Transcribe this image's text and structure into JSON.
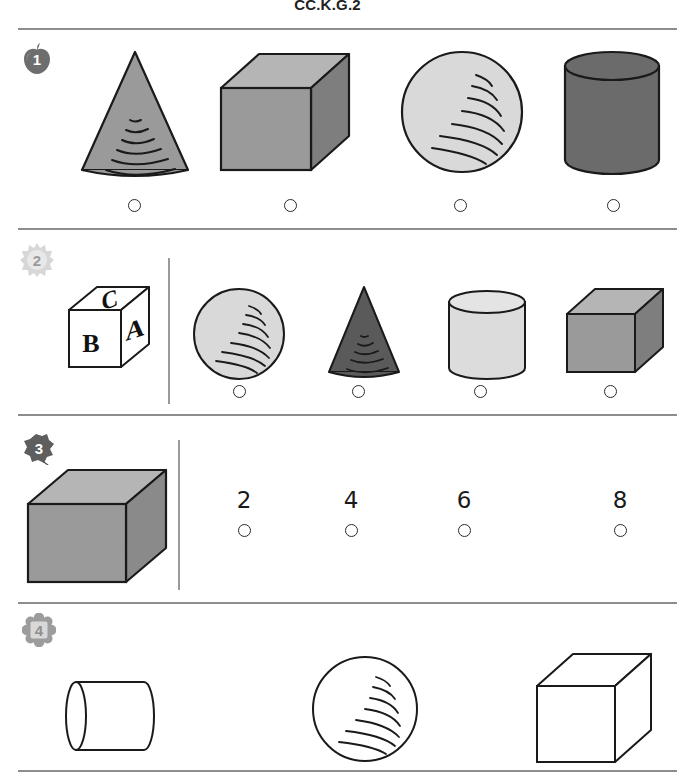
{
  "header": {
    "standard_code": "CC.K.G.2"
  },
  "palette": {
    "cone_fill_medium": "#9a9a9a",
    "cone_fill_dark": "#5a5a5a",
    "sphere_fill_light": "#d9d9d9",
    "cylinder_fill_dark": "#6b6b6b",
    "cylinder_fill_light": "#dcdcdc",
    "cube_fill_medium": "#9a9a9a",
    "cube_top_light": "#b5b5b5",
    "cube_side_dark": "#7e7e7e",
    "outline": "#1a1a1a",
    "rule_gray": "#8d8d8d",
    "white": "#ffffff"
  },
  "questions": [
    {
      "number": "1",
      "badge_icon": "apple-badge-icon",
      "choices": [
        {
          "shape": "cone",
          "fill": "medium",
          "bubble_label": "option-a"
        },
        {
          "shape": "cube",
          "fill": "medium",
          "bubble_label": "option-b"
        },
        {
          "shape": "sphere",
          "fill": "light",
          "bubble_label": "option-c"
        },
        {
          "shape": "cylinder",
          "fill": "dark",
          "bubble_label": "option-d"
        }
      ]
    },
    {
      "number": "2",
      "badge_icon": "sunburst-badge-icon",
      "prompt_shape": "alphabet-block-cube",
      "prompt_letters": {
        "top": "C",
        "left": "B",
        "right": "A"
      },
      "choices": [
        {
          "shape": "sphere",
          "fill": "light",
          "bubble_label": "option-a"
        },
        {
          "shape": "cone",
          "fill": "dark",
          "bubble_label": "option-b"
        },
        {
          "shape": "cylinder",
          "fill": "light",
          "bubble_label": "option-c"
        },
        {
          "shape": "cube",
          "fill": "medium",
          "bubble_label": "option-d"
        }
      ]
    },
    {
      "number": "3",
      "badge_icon": "leaf-badge-icon",
      "prompt_shape": "cube",
      "choices": [
        {
          "value": "2",
          "bubble_label": "option-a"
        },
        {
          "value": "4",
          "bubble_label": "option-b"
        },
        {
          "value": "6",
          "bubble_label": "option-c"
        },
        {
          "value": "8",
          "bubble_label": "option-d"
        }
      ]
    },
    {
      "number": "4",
      "badge_icon": "flower-badge-icon",
      "choices": [
        {
          "shape": "cylinder-horizontal",
          "fill": "white"
        },
        {
          "shape": "sphere",
          "fill": "white"
        },
        {
          "shape": "cube",
          "fill": "white"
        }
      ]
    }
  ]
}
